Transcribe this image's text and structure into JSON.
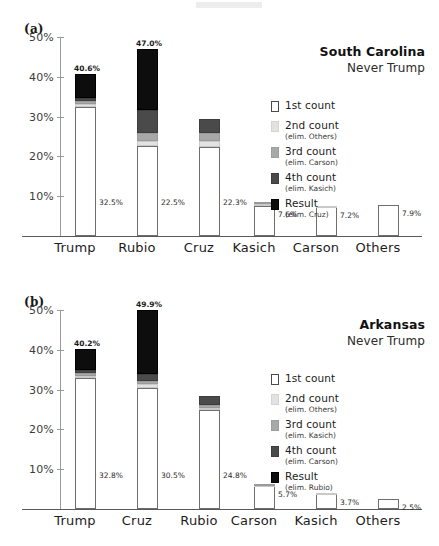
{
  "figure": {
    "background": "#ffffff",
    "width": 439,
    "height": 546
  },
  "panels": [
    {
      "id": "a",
      "letter": "(a)",
      "title": "South Carolina",
      "subtitle": "Never Trump",
      "legend": [
        {
          "label": "1st count",
          "sub": "",
          "color": "#ffffff",
          "swatch": "sw1"
        },
        {
          "label": "2nd count",
          "sub": "(elim. Others)",
          "color": "#e2e2e2",
          "swatch": "sw2"
        },
        {
          "label": "3rd count",
          "sub": "(elim. Carson)",
          "color": "#a8a8a8",
          "swatch": "sw3"
        },
        {
          "label": "4th count",
          "sub": "(elim. Kasich)",
          "color": "#4a4a4a",
          "swatch": "sw4"
        },
        {
          "label": "Result",
          "sub": "(elim. Cruz)",
          "color": "#0d0d0d",
          "swatch": "sw5"
        }
      ],
      "yticks": [
        "10%",
        "20%",
        "30%",
        "40%",
        "50%"
      ],
      "categories": [
        "Trump",
        "Rubio",
        "Cruz",
        "Kasich",
        "Carson",
        "Others"
      ],
      "top_labels": [
        "40.6%",
        "47.0%",
        "",
        "",
        "",
        ""
      ],
      "first_labels": [
        "32.5%",
        "22.5%",
        "22.3%",
        "7.6%",
        "7.2%",
        "7.9%"
      ]
    },
    {
      "id": "b",
      "letter": "(b)",
      "title": "Arkansas",
      "subtitle": "Never Trump",
      "legend": [
        {
          "label": "1st count",
          "sub": "",
          "color": "#ffffff",
          "swatch": "sw1"
        },
        {
          "label": "2nd count",
          "sub": "(elim. Others)",
          "color": "#e2e2e2",
          "swatch": "sw2"
        },
        {
          "label": "3rd count",
          "sub": "(elim. Kasich)",
          "color": "#a8a8a8",
          "swatch": "sw3"
        },
        {
          "label": "4th count",
          "sub": "(elim. Carson)",
          "color": "#4a4a4a",
          "swatch": "sw4"
        },
        {
          "label": "Result",
          "sub": "(elim. Rubio)",
          "color": "#0d0d0d",
          "swatch": "sw5"
        }
      ],
      "yticks": [
        "10%",
        "20%",
        "30%",
        "40%",
        "50%"
      ],
      "categories": [
        "Trump",
        "Cruz",
        "Rubio",
        "Carson",
        "Kasich",
        "Others"
      ],
      "top_labels": [
        "40.2%",
        "49.9%",
        "",
        "",
        "",
        ""
      ],
      "first_labels": [
        "32.8%",
        "30.5%",
        "24.8%",
        "5.7%",
        "3.7%",
        "2.5%"
      ]
    }
  ],
  "chart_data": [
    {
      "type": "bar",
      "stacked": true,
      "title": "South Carolina",
      "subtitle": "Never Trump",
      "panel": "(a)",
      "xlabel": "",
      "ylabel": "",
      "ylim": [
        0,
        53
      ],
      "yticks": [
        10,
        20,
        30,
        40,
        50
      ],
      "ytick_labels": [
        "10%",
        "20%",
        "30%",
        "40%",
        "50%"
      ],
      "grid": false,
      "legend_position": "right",
      "categories": [
        "Trump",
        "Rubio",
        "Cruz",
        "Kasich",
        "Carson",
        "Others"
      ],
      "series": [
        {
          "name": "1st count",
          "note": "",
          "color": "#ffffff",
          "values": [
            32.5,
            22.5,
            22.3,
            7.6,
            7.2,
            7.9
          ]
        },
        {
          "name": "2nd count",
          "note": "(elim. Others)",
          "color": "#e2e2e2",
          "values": [
            0.6,
            1.3,
            1.5,
            0.5,
            0.4,
            0.0
          ]
        },
        {
          "name": "3rd count",
          "note": "(elim. Carson)",
          "color": "#a8a8a8",
          "values": [
            0.7,
            2.1,
            2.1,
            0.5,
            0.0,
            0.0
          ]
        },
        {
          "name": "4th count",
          "note": "(elim. Kasich)",
          "color": "#4a4a4a",
          "values": [
            0.8,
            5.7,
            3.4,
            0.0,
            0.0,
            0.0
          ]
        },
        {
          "name": "Result",
          "note": "(elim. Cruz)",
          "color": "#0d0d0d",
          "values": [
            6.0,
            15.4,
            0.0,
            0.0,
            0.0,
            0.0
          ]
        }
      ],
      "totals": [
        40.6,
        47.0,
        29.3,
        8.6,
        7.6,
        7.9
      ],
      "annotations": {
        "top_labels": [
          "40.6%",
          "47.0%",
          "",
          "",
          "",
          ""
        ],
        "first_count_labels": [
          "32.5%",
          "22.5%",
          "22.3%",
          "7.6%",
          "7.2%",
          "7.9%"
        ]
      }
    },
    {
      "type": "bar",
      "stacked": true,
      "title": "Arkansas",
      "subtitle": "Never Trump",
      "panel": "(b)",
      "xlabel": "",
      "ylabel": "",
      "ylim": [
        0,
        53
      ],
      "yticks": [
        10,
        20,
        30,
        40,
        50
      ],
      "ytick_labels": [
        "10%",
        "20%",
        "30%",
        "40%",
        "50%"
      ],
      "grid": false,
      "legend_position": "right",
      "categories": [
        "Trump",
        "Cruz",
        "Rubio",
        "Carson",
        "Kasich",
        "Others"
      ],
      "series": [
        {
          "name": "1st count",
          "note": "",
          "color": "#ffffff",
          "values": [
            32.8,
            30.5,
            24.8,
            5.7,
            3.7,
            2.5
          ]
        },
        {
          "name": "2nd count",
          "note": "(elim. Others)",
          "color": "#e2e2e2",
          "values": [
            0.7,
            0.9,
            0.6,
            0.3,
            0.2,
            0.0
          ]
        },
        {
          "name": "3rd count",
          "note": "(elim. Kasich)",
          "color": "#a8a8a8",
          "values": [
            0.6,
            0.8,
            0.8,
            0.3,
            0.0,
            0.0
          ]
        },
        {
          "name": "4th count",
          "note": "(elim. Carson)",
          "color": "#4a4a4a",
          "values": [
            0.8,
            1.8,
            2.1,
            0.0,
            0.0,
            0.0
          ]
        },
        {
          "name": "Result",
          "note": "(elim. Rubio)",
          "color": "#0d0d0d",
          "values": [
            5.3,
            15.9,
            0.0,
            0.0,
            0.0,
            0.0
          ]
        }
      ],
      "totals": [
        40.2,
        49.9,
        28.3,
        6.3,
        3.9,
        2.5
      ],
      "annotations": {
        "top_labels": [
          "40.2%",
          "49.9%",
          "",
          "",
          "",
          ""
        ],
        "first_count_labels": [
          "32.8%",
          "30.5%",
          "24.8%",
          "5.7%",
          "3.7%",
          "2.5%"
        ]
      }
    }
  ]
}
